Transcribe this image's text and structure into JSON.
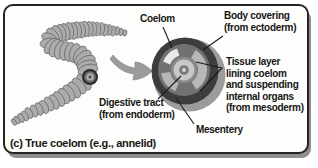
{
  "caption": "(c) True coelom (e.g., annelid)",
  "labels": {
    "coelom": "Coelom",
    "body_covering": "Body covering\n(from ectoderm)",
    "tissue_layer": "Tissue layer\nlining coelom\nand suspending\ninternal organs\n(from mesoderm)",
    "digestive_tract": "Digestive tract\n(from endoderm)",
    "mesentery": "Mesentery"
  },
  "colors": {
    "panel_border": "#232321",
    "panel_bg": "#fdfdfb",
    "panel_shadow": "#8e8e8c",
    "worm_body": "#acacaa",
    "worm_outline": "#6b6b69",
    "arrow": "#9c9c9a",
    "arrow_outline": "#7e7e7c",
    "cylinder_side": "#9b9b99",
    "ectoderm_ring": "#3d3d3b",
    "mesoderm": "#71716f",
    "coelom_cavity": "#b7b7b5",
    "coelom_highlight": "#e9e9e7",
    "inner_ring": "#8a8a88",
    "digestive_center": "#c8c8c6",
    "digestive_dot": "#787876",
    "lumen": "#d2d2d0",
    "leader_line": "#1a1a18",
    "text": "#161614"
  }
}
